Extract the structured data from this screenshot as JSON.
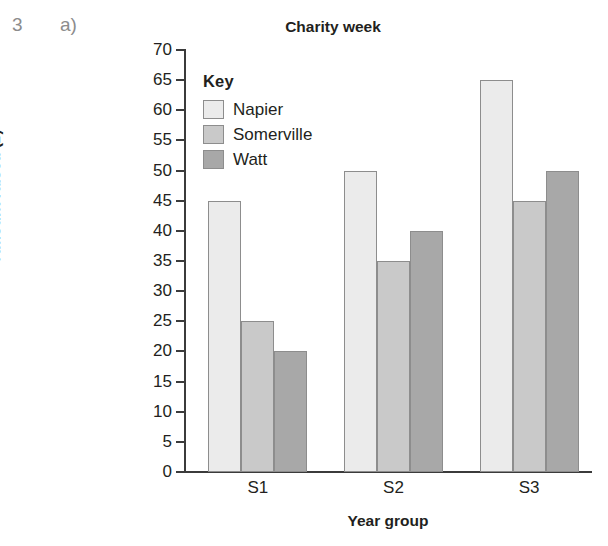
{
  "question": {
    "number": "3",
    "part": "a)"
  },
  "chart_data": {
    "type": "bar",
    "title": "Charity week",
    "xlabel": "Year group",
    "ylabel": "Amount raised (£)",
    "categories": [
      "S1",
      "S2",
      "S3"
    ],
    "series": [
      {
        "name": "Napier",
        "values": [
          45,
          50,
          65
        ],
        "color": "#ebebeb"
      },
      {
        "name": "Somerville",
        "values": [
          25,
          35,
          45
        ],
        "color": "#c9c9c9"
      },
      {
        "name": "Watt",
        "values": [
          20,
          40,
          50
        ],
        "color": "#a8a8a8"
      }
    ],
    "ylim": [
      0,
      70
    ],
    "ytick_step": 5,
    "yticks": [
      0,
      5,
      10,
      15,
      20,
      25,
      30,
      35,
      40,
      45,
      50,
      55,
      60,
      65,
      70
    ],
    "ytick_labels": [
      "0",
      "5",
      "10",
      "15",
      "20",
      "25",
      "30",
      "35",
      "40",
      "45",
      "50",
      "55",
      "60",
      "65",
      "70"
    ],
    "grid": false,
    "legend_position": "inside-top-left",
    "legend_title": "Key",
    "bar_border_color": "#8d8d8d",
    "axis_color": "#3b3b3b"
  }
}
